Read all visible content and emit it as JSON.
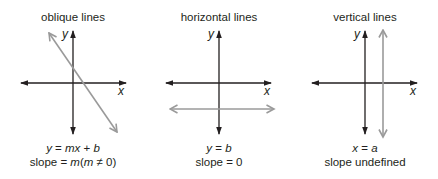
{
  "colors": {
    "axis": "#231f20",
    "line": "#9a9a9a",
    "text": "#231f20",
    "background": "#ffffff"
  },
  "panels": [
    {
      "title": "oblique lines",
      "x_label": "x",
      "y_label": "y",
      "equation": {
        "lhs": "y",
        "eq": " = ",
        "var": "mx",
        "op": " + ",
        "const": "b"
      },
      "slope": {
        "prefix": "slope = ",
        "m": "m",
        "paren_open": "(",
        "m2": "m",
        "cond": " ≠ 0)"
      }
    },
    {
      "title": "horizontal lines",
      "x_label": "x",
      "y_label": "y",
      "equation": {
        "lhs": "y",
        "eq": " = ",
        "rhs": "b"
      },
      "slope": {
        "text": "slope = 0"
      }
    },
    {
      "title": "vertical lines",
      "x_label": "x",
      "y_label": "y",
      "equation": {
        "lhs": "x",
        "eq": " = ",
        "rhs": "a"
      },
      "slope": {
        "text": "slope undefined"
      }
    }
  ]
}
